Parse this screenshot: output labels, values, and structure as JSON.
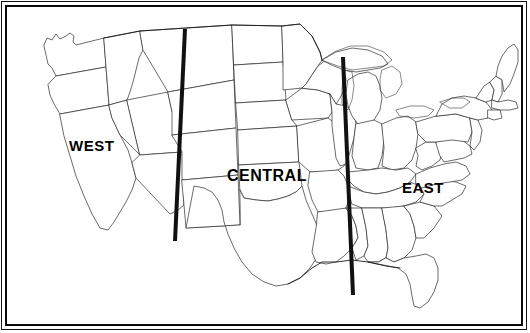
{
  "figure": {
    "width": 530,
    "height": 333,
    "background_color": "#ffffff",
    "border": {
      "outer_color": "#111111",
      "inner_color": "#0a0a0a",
      "style": "double-rule"
    }
  },
  "map": {
    "outline_color": "#1a1a1a",
    "fill_color": "#ffffff",
    "state_border_color": "#333333"
  },
  "divider_lines": [
    {
      "name": "west-central-divider",
      "color": "#111111",
      "thickness": 4,
      "x1": 185,
      "y1": 29,
      "x2": 175,
      "y2": 241
    },
    {
      "name": "central-east-divider",
      "color": "#111111",
      "thickness": 4,
      "x1": 343,
      "y1": 57,
      "x2": 353,
      "y2": 295
    }
  ],
  "labels": {
    "west": "WEST",
    "central": "CENTRAL",
    "east": "EAST"
  }
}
